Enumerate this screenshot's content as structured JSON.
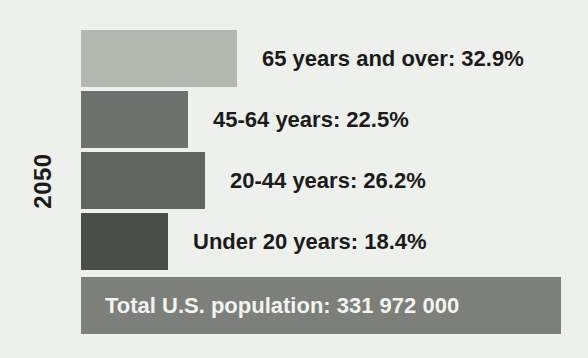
{
  "chart_data": {
    "type": "bar",
    "orientation": "horizontal",
    "year": "2050",
    "categories": [
      "65 years and over",
      "45-64 years",
      "20-44 years",
      "Under 20 years"
    ],
    "values": [
      32.9,
      22.5,
      26.2,
      18.4
    ],
    "unit": "%",
    "labels": [
      "65 years and over: 32.9%",
      "45-64 years: 22.5%",
      "20-44 years: 26.2%",
      "Under 20 years: 18.4%"
    ],
    "bar_colors": [
      "#b5b8b1",
      "#6f716f",
      "#626461",
      "#4b4d4b"
    ],
    "total_bar": {
      "label": "Total U.S. population: 331 972 000",
      "value": "331 972 000",
      "color": "#7d7f7b",
      "text_color": "#f3f3f0"
    },
    "xlim": [
      0,
      100
    ],
    "grid": false,
    "legend": false,
    "axis_ticks_visible": false
  },
  "colors": {
    "background": "#eef0ec",
    "label_text": "#1b1b1b"
  }
}
